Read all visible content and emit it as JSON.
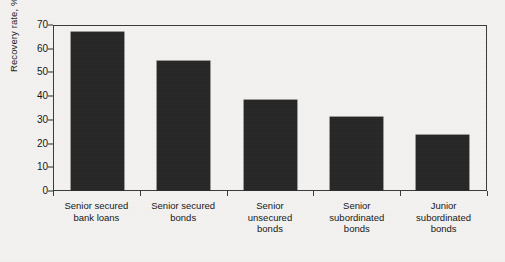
{
  "chart_data": {
    "type": "bar",
    "title": "",
    "subtitle": "",
    "xlabel": "",
    "ylabel": "Recovery rate, %",
    "ylim": [
      0,
      70
    ],
    "yticks": [
      0,
      10,
      20,
      30,
      40,
      50,
      60,
      70
    ],
    "grid": false,
    "legend": false,
    "legend_position": "none",
    "bar_color": "#262626",
    "axis_color": "#3a3a3a",
    "background_color": "#f3f2f0",
    "categories": [
      "Senior secured\nbank loans",
      "Senior secured\nbonds",
      "Senior\nunsecured\nbonds",
      "Senior\nsubordinated\nbonds",
      "Junior\nsubordinated\nbonds"
    ],
    "category_lines": [
      [
        "Senior secured",
        "bank loans"
      ],
      [
        "Senior secured",
        "bonds"
      ],
      [
        "Senior",
        "unsecured",
        "bonds"
      ],
      [
        "Senior",
        "subordinated",
        "bonds"
      ],
      [
        "Junior",
        "subordinated",
        "bonds"
      ]
    ],
    "values": [
      66.5,
      54.5,
      38,
      31,
      23
    ]
  },
  "axis": {
    "y_title": "Recovery rate, %",
    "tick_labels": [
      "70",
      "60",
      "50",
      "40",
      "30",
      "20",
      "10",
      "0"
    ]
  }
}
